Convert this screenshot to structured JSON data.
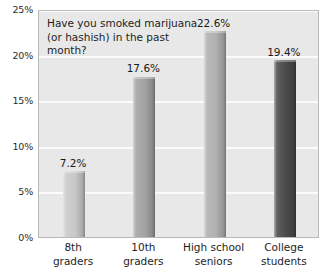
{
  "chart_data": {
    "type": "bar",
    "title": "Have you smoked marijuana (or hashish) in the past month?",
    "title_lines": [
      "Have you smoked marijuana",
      "(or hashish) in the past",
      "month?"
    ],
    "categories": [
      "8th graders",
      "10th graders",
      "High school seniors",
      "College students"
    ],
    "category_lines": [
      [
        "8th",
        "graders"
      ],
      [
        "10th",
        "graders"
      ],
      [
        "High school",
        "seniors"
      ],
      [
        "College",
        "students"
      ]
    ],
    "values": [
      7.2,
      17.6,
      22.6,
      19.4
    ],
    "value_labels": [
      "7.2%",
      "17.6%",
      "22.6%",
      "19.4%"
    ],
    "bar_colors": [
      "#c9c9c9",
      "#a2a2a2",
      "#b0b0b0",
      "#4a4a4a"
    ],
    "xlabel": "",
    "ylabel": "",
    "ylim": [
      0,
      25
    ],
    "ytick_values": [
      0,
      5,
      10,
      15,
      20,
      25
    ],
    "ytick_labels": [
      "0%",
      "5%",
      "10%",
      "15%",
      "20%",
      "25%"
    ],
    "grid": true,
    "grid_axis": "y",
    "legend": "none",
    "plot_background": "#e8e8e8",
    "gridline_color": "#fbfbfb"
  }
}
